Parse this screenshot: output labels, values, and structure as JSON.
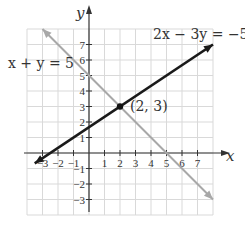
{
  "chart_data": {
    "type": "line",
    "title": "",
    "xlabel": "x",
    "ylabel": "y",
    "xlim": [
      -4,
      8
    ],
    "ylim": [
      -4,
      8
    ],
    "grid": true,
    "x_ticks": [
      "-3",
      "-2",
      "-1",
      "1",
      "2",
      "3",
      "4",
      "5",
      "6",
      "7"
    ],
    "y_ticks": [
      "7",
      "6",
      "5",
      "4",
      "3",
      "2",
      "1",
      "-1",
      "-2",
      "-3"
    ],
    "series": [
      {
        "name": "x + y = 5",
        "label": "x + y = 5",
        "color": "#a8a8a8",
        "x": [
          -3,
          8
        ],
        "y": [
          8,
          -3
        ]
      },
      {
        "name": "2x − 3y = −5",
        "label": "2x − 3y = −5",
        "color": "#1a1a1a",
        "x": [
          -3.5,
          8
        ],
        "y": [
          -0.667,
          7
        ]
      }
    ],
    "annotations": [
      {
        "text": "(2, 3)",
        "x": 2,
        "y": 3,
        "marker": "point"
      }
    ]
  },
  "labels": {
    "x_axis": "x",
    "y_axis": "y",
    "line1": "x + y = 5",
    "line2": "2x − 3y = −5",
    "point": "(2, 3)"
  }
}
